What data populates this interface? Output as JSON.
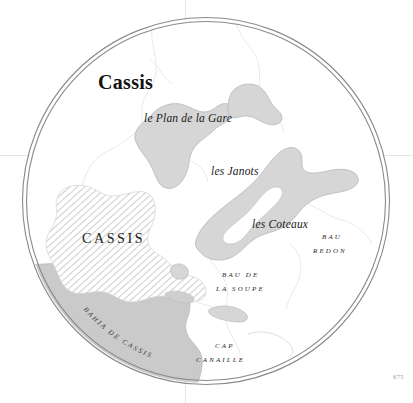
{
  "map": {
    "title": "Cassis",
    "page_number": "675",
    "colors": {
      "land": "#d6d6d6",
      "land_outline": "#b4b4b4",
      "water_bay": "#c9c9c9",
      "urban_hatch": "#c6c6c6",
      "border_line": "#7a7a7a",
      "grid_line": "#e2e2e2",
      "background": "#ffffff",
      "text": "#1d1d1d"
    },
    "labels": [
      {
        "id": "title",
        "text": "Cassis",
        "style": "title"
      },
      {
        "id": "plan-de-la-gare",
        "text": "le Plan de la Gare",
        "style": "italic"
      },
      {
        "id": "les-janots",
        "text": "les Janots",
        "style": "italic"
      },
      {
        "id": "les-coteaux",
        "text": "les Coteaux",
        "style": "italic"
      },
      {
        "id": "cassis-town",
        "text": "CASSIS",
        "style": "town"
      },
      {
        "id": "bau-redon-1",
        "text": "BAU",
        "style": "caps"
      },
      {
        "id": "bau-redon-2",
        "text": "REDON",
        "style": "caps"
      },
      {
        "id": "bau-de-soupe-1",
        "text": "BAU DE",
        "style": "caps"
      },
      {
        "id": "bau-de-soupe-2",
        "text": "LA SOUPE",
        "style": "caps"
      },
      {
        "id": "cap-canaille-1",
        "text": "CAP",
        "style": "caps"
      },
      {
        "id": "cap-canaille-2",
        "text": "CANAILLE",
        "style": "caps"
      },
      {
        "id": "bahia-de-cassis",
        "text": "BAHIA DE CASSIS",
        "style": "curved"
      }
    ]
  }
}
